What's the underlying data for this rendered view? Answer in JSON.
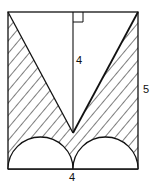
{
  "diagram": {
    "type": "geometry-figure",
    "labels": {
      "height_of_triangle": "4",
      "rect_height": "5",
      "rect_width": "4"
    },
    "colors": {
      "stroke": "#111111",
      "fill": "#ffffff"
    },
    "elements": {
      "rectangle": {
        "width": 4,
        "height": 5
      },
      "triangle_altitude": 4,
      "right_angle_marker": "top center",
      "semicircles": 2,
      "hatching": "diagonal lines"
    }
  }
}
